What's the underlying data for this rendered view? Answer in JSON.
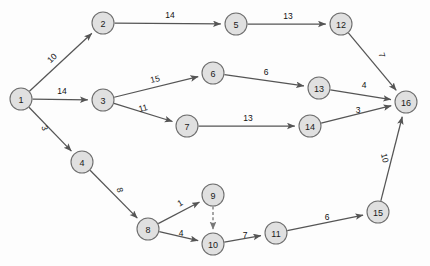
{
  "diagram": {
    "type": "directed-weighted-graph",
    "background_color": "#fdfdfd",
    "node_fill_color": "#e0e0e0",
    "node_stroke_color": "#6e6e6e",
    "edge_color": "#555555",
    "dashed_edge_color": "#777777",
    "node_radius": 11,
    "nodes": [
      {
        "id": "1",
        "label": "1",
        "x": 21,
        "y": 99
      },
      {
        "id": "2",
        "label": "2",
        "x": 103,
        "y": 23
      },
      {
        "id": "3",
        "label": "3",
        "x": 103,
        "y": 100
      },
      {
        "id": "4",
        "label": "4",
        "x": 82,
        "y": 162
      },
      {
        "id": "5",
        "label": "5",
        "x": 236,
        "y": 24
      },
      {
        "id": "6",
        "label": "6",
        "x": 213,
        "y": 73
      },
      {
        "id": "7",
        "label": "7",
        "x": 187,
        "y": 126
      },
      {
        "id": "8",
        "label": "8",
        "x": 148,
        "y": 229
      },
      {
        "id": "9",
        "label": "9",
        "x": 213,
        "y": 195
      },
      {
        "id": "10",
        "label": "10",
        "x": 213,
        "y": 244
      },
      {
        "id": "11",
        "label": "11",
        "x": 276,
        "y": 233
      },
      {
        "id": "12",
        "label": "12",
        "x": 341,
        "y": 24
      },
      {
        "id": "13",
        "label": "13",
        "x": 319,
        "y": 88
      },
      {
        "id": "14",
        "label": "14",
        "x": 310,
        "y": 126
      },
      {
        "id": "15",
        "label": "15",
        "x": 378,
        "y": 212
      },
      {
        "id": "16",
        "label": "16",
        "x": 406,
        "y": 102
      }
    ],
    "edges": [
      {
        "from": "1",
        "to": "2",
        "weight": "10",
        "style": "solid",
        "label_x": 52,
        "label_y": 58,
        "label_rotate": -43
      },
      {
        "from": "1",
        "to": "3",
        "weight": "14",
        "style": "solid",
        "label_x": 62,
        "label_y": 91,
        "label_rotate": 0
      },
      {
        "from": "1",
        "to": "4",
        "weight": "3",
        "style": "solid",
        "label_x": 45,
        "label_y": 128,
        "label_rotate": 70
      },
      {
        "from": "2",
        "to": "5",
        "weight": "14",
        "style": "solid",
        "label_x": 170,
        "label_y": 15,
        "label_rotate": 0
      },
      {
        "from": "3",
        "to": "6",
        "weight": "15",
        "style": "solid",
        "label_x": 155,
        "label_y": 79,
        "label_rotate": -13
      },
      {
        "from": "3",
        "to": "7",
        "weight": "11",
        "style": "solid",
        "label_x": 143,
        "label_y": 108,
        "label_rotate": -15
      },
      {
        "from": "4",
        "to": "8",
        "weight": "8",
        "style": "solid",
        "label_x": 120,
        "label_y": 190,
        "label_rotate": 75
      },
      {
        "from": "5",
        "to": "12",
        "weight": "13",
        "style": "solid",
        "label_x": 288,
        "label_y": 16,
        "label_rotate": 0
      },
      {
        "from": "6",
        "to": "13",
        "weight": "6",
        "style": "solid",
        "label_x": 266,
        "label_y": 72,
        "label_rotate": 0
      },
      {
        "from": "7",
        "to": "14",
        "weight": "13",
        "style": "solid",
        "label_x": 248,
        "label_y": 118,
        "label_rotate": 0
      },
      {
        "from": "8",
        "to": "9",
        "weight": "1",
        "style": "solid",
        "label_x": 180,
        "label_y": 203,
        "label_rotate": -30
      },
      {
        "from": "8",
        "to": "10",
        "weight": "4",
        "style": "solid",
        "label_x": 181,
        "label_y": 233,
        "label_rotate": 0
      },
      {
        "from": "9",
        "to": "10",
        "weight": "",
        "style": "dashed",
        "label_x": 0,
        "label_y": 0,
        "label_rotate": 0
      },
      {
        "from": "10",
        "to": "11",
        "weight": "7",
        "style": "solid",
        "label_x": 245,
        "label_y": 235,
        "label_rotate": 0
      },
      {
        "from": "11",
        "to": "15",
        "weight": "6",
        "style": "solid",
        "label_x": 327,
        "label_y": 217,
        "label_rotate": 0
      },
      {
        "from": "12",
        "to": "16",
        "weight": "7",
        "style": "solid",
        "label_x": 382,
        "label_y": 55,
        "label_rotate": 75
      },
      {
        "from": "13",
        "to": "16",
        "weight": "4",
        "style": "solid",
        "label_x": 364,
        "label_y": 85,
        "label_rotate": 0
      },
      {
        "from": "14",
        "to": "16",
        "weight": "3",
        "style": "solid",
        "label_x": 358,
        "label_y": 110,
        "label_rotate": 0
      },
      {
        "from": "15",
        "to": "16",
        "weight": "10",
        "style": "solid",
        "label_x": 385,
        "label_y": 158,
        "label_rotate": 78
      }
    ]
  }
}
